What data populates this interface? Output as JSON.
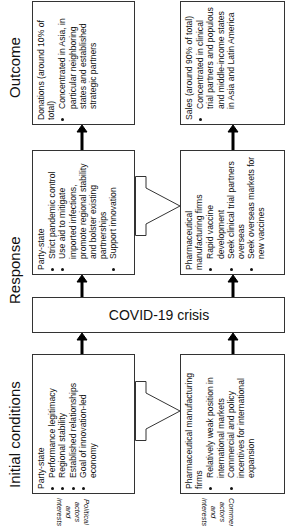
{
  "columns": {
    "initial": "Initial conditions",
    "response": "Response",
    "outcome": "Outcome"
  },
  "rows": {
    "political": "Political actors and interests",
    "commercial": "Commercial actors and interests"
  },
  "center": "COVID-19 crisis",
  "boxes": {
    "initial_political": {
      "head": "Party-state",
      "items": [
        "Performance legitimacy",
        "Regional stability",
        "Established relationships",
        "Goal of innovation-led economy"
      ]
    },
    "initial_commercial": {
      "head": "Pharmaceutical manufacturing firms",
      "items": [
        "Relatively weak position in international markets",
        "Commercial and policy incentives for international expansion"
      ]
    },
    "response_political": {
      "head": "Party-state",
      "items": [
        "Strict pandemic control",
        "Use aid to mitigate imported infections, promote regional stability and bolster existing partnerships",
        "Support innovation"
      ]
    },
    "response_commercial": {
      "head": "Pharmaceutical manufacturing firms",
      "items": [
        "Rapid vaccine development",
        "Seek clinical trial partners overseas",
        "Seek overseas markets for new vaccines"
      ]
    },
    "outcome_political": {
      "head": "Donations (around 10% of total)",
      "items": [
        "Concentrated in Asia, in particular neighboring states and established strategic partners"
      ]
    },
    "outcome_commercial": {
      "head": "Sales (around 90% of total)",
      "items": [
        "Concentrated in clinical trial partners and populous and middle-income states in Asia and Latin America"
      ]
    }
  },
  "links": {
    "initial": "Industrial strategy",
    "response": "Support vaccine development"
  }
}
